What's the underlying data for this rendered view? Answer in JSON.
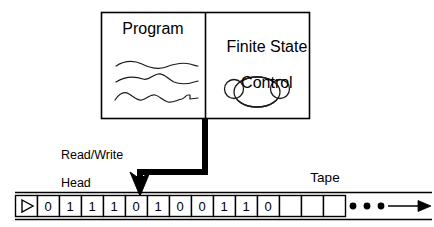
{
  "diagram": {
    "background_color": "#ffffff",
    "stroke_color": "#000000"
  },
  "machine_box": {
    "program": {
      "label": "Program",
      "squiggle_count": 3
    },
    "control": {
      "label": "Finite State\nControl",
      "label_line1": "Finite State",
      "label_line2": "Control",
      "state_bubble_count": 3
    }
  },
  "head": {
    "label_line1": "Read/Write",
    "label_line2": "Head",
    "points_at_cell_index": 5,
    "connector_color": "#000000"
  },
  "tape": {
    "label": "Tape",
    "start_marker_icon": "right-triangle-icon",
    "cell_count": 16,
    "cells": [
      {
        "index": 0,
        "value": "",
        "type": "start-marker"
      },
      {
        "index": 1,
        "value": "0",
        "type": "symbol"
      },
      {
        "index": 2,
        "value": "1",
        "type": "symbol"
      },
      {
        "index": 3,
        "value": "1",
        "type": "symbol"
      },
      {
        "index": 4,
        "value": "1",
        "type": "symbol"
      },
      {
        "index": 5,
        "value": "0",
        "type": "symbol"
      },
      {
        "index": 6,
        "value": "1",
        "type": "symbol"
      },
      {
        "index": 7,
        "value": "0",
        "type": "symbol"
      },
      {
        "index": 8,
        "value": "0",
        "type": "symbol"
      },
      {
        "index": 9,
        "value": "1",
        "type": "symbol"
      },
      {
        "index": 10,
        "value": "1",
        "type": "symbol"
      },
      {
        "index": 11,
        "value": "0",
        "type": "symbol"
      },
      {
        "index": 12,
        "value": "",
        "type": "blank"
      },
      {
        "index": 13,
        "value": "",
        "type": "blank"
      },
      {
        "index": 14,
        "value": "",
        "type": "blank"
      },
      {
        "index": 15,
        "value": "",
        "type": "ellipsis"
      }
    ],
    "symbol_sequence": "0 1 1 1 0 1 0 0 1 1 0",
    "blank_cell_count": 3,
    "ellipsis_dot_count": 3,
    "continues_right": true,
    "right_arrow_icon": "arrow-right-icon"
  }
}
